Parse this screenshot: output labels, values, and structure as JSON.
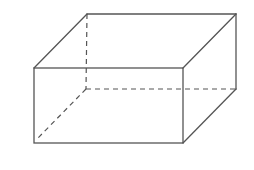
{
  "diagram": {
    "type": "cuboid",
    "stroke_color": "#555555",
    "background": "#ffffff",
    "vertices": {
      "front_top_left": [
        34,
        68
      ],
      "front_top_right": [
        183,
        68
      ],
      "front_bottom_left": [
        34,
        143
      ],
      "front_bottom_right": [
        183,
        143
      ],
      "back_top_left": [
        87,
        14
      ],
      "back_top_right": [
        236,
        14
      ],
      "back_bottom_right": [
        236,
        89
      ],
      "back_bottom_left": [
        86,
        89
      ]
    },
    "visible_edges": 9,
    "hidden_edges": 3
  }
}
